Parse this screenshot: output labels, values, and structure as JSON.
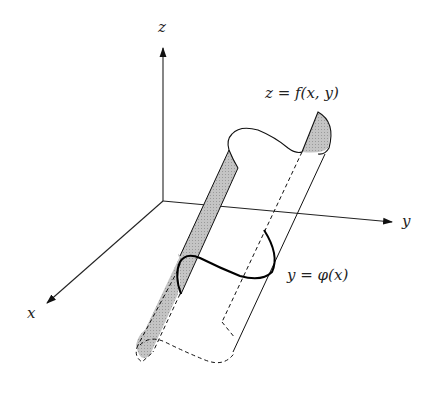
{
  "diagram": {
    "title": "",
    "axes": {
      "x_label": "x",
      "y_label": "y",
      "z_label": "z"
    },
    "labels": {
      "surface": "z = f(x, y)",
      "curve": "y = φ(x)"
    },
    "colors": {
      "stroke": "#111111",
      "shade": "#bdbdbd",
      "background": "#ffffff"
    }
  }
}
